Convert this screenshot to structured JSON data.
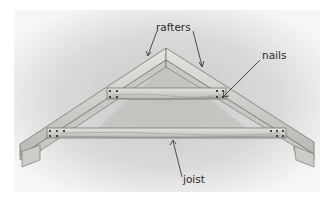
{
  "diagram": {
    "labels": {
      "rafters": "rafters",
      "nails": "nails",
      "joist": "joist"
    },
    "colors": {
      "background_wash": "#d6d6d6",
      "wood_light": "#dcdcd6",
      "wood_mid": "#c4c4be",
      "wood_dark": "#a8a8a2",
      "outline": "#6a6a66",
      "nail": "#222222",
      "label": "#2a2a2a"
    }
  }
}
